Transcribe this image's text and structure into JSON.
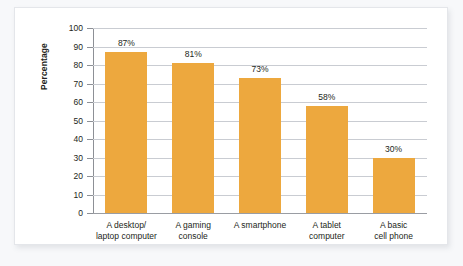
{
  "chart_data": {
    "type": "bar",
    "title": "",
    "subtitle": "",
    "xlabel": "",
    "ylabel": "Percentage",
    "ylim": [
      0,
      100
    ],
    "ytick_step": 10,
    "yticks": [
      100,
      90,
      80,
      70,
      60,
      50,
      40,
      30,
      20,
      10,
      0
    ],
    "ytick_labels": [
      "100",
      "90",
      "80",
      "70",
      "60",
      "50",
      "40",
      "30",
      "20",
      "10",
      "0"
    ],
    "grid": true,
    "grid_axis": "y",
    "legend": false,
    "legend_position": "none",
    "categories": [
      "A desktop/\nlaptop computer",
      "A gaming\nconsole",
      "A smartphone",
      "A tablet\ncomputer",
      "A basic\ncell phone"
    ],
    "values": [
      87,
      81,
      73,
      58,
      30
    ],
    "data_labels": [
      "87%",
      "81%",
      "73%",
      "58%",
      "30%"
    ],
    "bar_color": "#eda83e"
  },
  "style": {
    "page_background": "#f7f8fa",
    "panel_background": "#ffffff",
    "panel_border": "#e4e6ea",
    "gridline_color": "#c9ccd2",
    "axis_color": "#8d9096",
    "text_color": "#231f20"
  }
}
